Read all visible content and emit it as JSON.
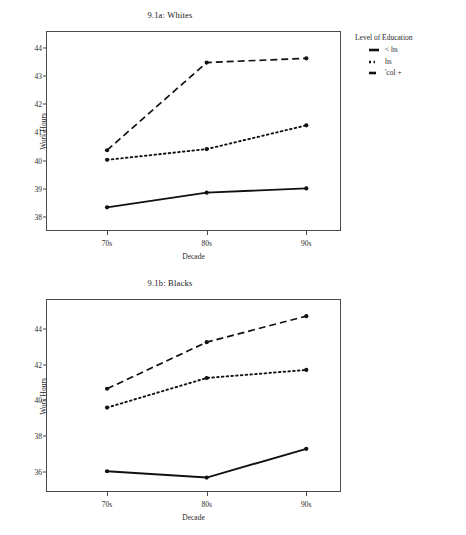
{
  "figures": [
    {
      "id": "a",
      "title": "9.1a: Whites",
      "xlabel": "Decade",
      "ylabel": "Work Hours",
      "legend_title": "Level of Education",
      "categories": [
        "70s",
        "80s",
        "90s"
      ],
      "yticks": [
        "38",
        "39",
        "40",
        "41",
        "42",
        "43",
        "44"
      ],
      "series": [
        {
          "name": "< hs",
          "style": "solid",
          "values": [
            38.35,
            38.87,
            39.02
          ]
        },
        {
          "name": "hs",
          "style": "dotted",
          "values": [
            40.03,
            40.41,
            41.25
          ]
        },
        {
          "name": "'col +",
          "style": "dashed",
          "values": [
            40.37,
            43.47,
            43.62
          ]
        }
      ]
    },
    {
      "id": "b",
      "title": "9.1b: Blacks",
      "xlabel": "Decade",
      "ylabel": "Work Hours",
      "legend_title": "Level of Education",
      "categories": [
        "70s",
        "80s",
        "90s"
      ],
      "yticks": [
        "36",
        "38",
        "40",
        "42",
        "44"
      ],
      "series": [
        {
          "name": "<hs",
          "style": "solid",
          "values": [
            36.05,
            35.7,
            37.3
          ]
        },
        {
          "name": "hs",
          "style": "dotted",
          "values": [
            39.6,
            41.25,
            41.7
          ]
        },
        {
          "name": "'col+",
          "style": "dashed",
          "values": [
            40.65,
            43.25,
            44.7
          ]
        }
      ]
    }
  ],
  "chart_data": [
    {
      "type": "line",
      "title": "9.1a: Whites",
      "xlabel": "Decade",
      "ylabel": "Work Hours",
      "legend_title": "Level of Education",
      "legend_position": "right",
      "grid": false,
      "categories": [
        "70s",
        "80s",
        "90s"
      ],
      "ylim": [
        37.55,
        44.55
      ],
      "yticks": [
        38,
        39,
        40,
        41,
        42,
        43,
        44
      ],
      "series": [
        {
          "name": "< hs",
          "values": [
            38.35,
            38.87,
            39.02
          ],
          "style": "solid",
          "color": "#111111"
        },
        {
          "name": "hs",
          "values": [
            40.03,
            40.41,
            41.25
          ],
          "style": "dotted",
          "color": "#111111"
        },
        {
          "name": "'col +",
          "values": [
            40.37,
            43.47,
            43.62
          ],
          "style": "dashed",
          "color": "#111111"
        }
      ]
    },
    {
      "type": "line",
      "title": "9.1b: Blacks",
      "xlabel": "Decade",
      "ylabel": "Work Hours",
      "legend_title": "Level of Education",
      "legend_position": "right",
      "grid": false,
      "categories": [
        "70s",
        "80s",
        "90s"
      ],
      "ylim": [
        34.95,
        45.6
      ],
      "yticks": [
        36,
        38,
        40,
        42,
        44
      ],
      "series": [
        {
          "name": "<hs",
          "values": [
            36.05,
            35.7,
            37.3
          ],
          "style": "solid",
          "color": "#111111"
        },
        {
          "name": "hs",
          "values": [
            39.6,
            41.25,
            41.7
          ],
          "style": "dotted",
          "color": "#111111"
        },
        {
          "name": "'col+",
          "values": [
            40.65,
            43.25,
            44.7
          ],
          "style": "dashed",
          "color": "#111111"
        }
      ]
    }
  ]
}
